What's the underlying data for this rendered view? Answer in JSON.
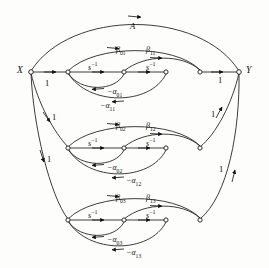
{
  "figure": {
    "nodes": {
      "source_label": "X",
      "sink_label": "Y"
    },
    "top_arc_label": "A",
    "gain_one": "1",
    "inverse_s": "s",
    "inverse_exponent": "−1",
    "left_gains": [
      "1",
      "1",
      "1"
    ],
    "right_gains": [
      "1",
      "1",
      "1"
    ],
    "rows": [
      {
        "index": 1,
        "beta0": "β",
        "beta0_sub": "01",
        "beta1": "β",
        "beta1_sub": "11",
        "alpha0": "−α",
        "alpha0_sub": "01",
        "alpha1": "−α",
        "alpha1_sub": "11",
        "s_left": "s",
        "s_right": "s",
        "s_exp": "−1"
      },
      {
        "index": 2,
        "beta0": "β",
        "beta0_sub": "02",
        "beta1": "β",
        "beta1_sub": "12",
        "alpha0": "−α",
        "alpha0_sub": "02",
        "alpha1": "−α",
        "alpha1_sub": "12",
        "s_left": "s",
        "s_right": "s",
        "s_exp": "−1"
      },
      {
        "index": 3,
        "beta0": "β",
        "beta0_sub": "03",
        "beta1": "β",
        "beta1_sub": "13",
        "alpha0": "−α",
        "alpha0_sub": "03",
        "alpha1": "−α",
        "alpha1_sub": "13",
        "s_left": "s",
        "s_right": "s",
        "s_exp": "−1"
      }
    ]
  },
  "colors": {
    "ink": "#1a1a1a",
    "paper": "#fdfdfc"
  }
}
